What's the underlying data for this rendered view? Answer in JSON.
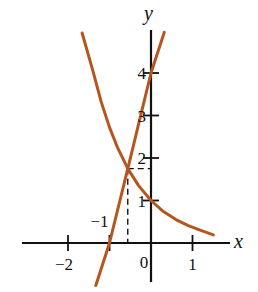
{
  "chart_data": {
    "type": "line",
    "title": "",
    "xlabel": "x",
    "ylabel": "y",
    "xlim": [
      -2.1,
      1.9
    ],
    "ylim": [
      -1.0,
      4.9
    ],
    "grid": false,
    "x_ticks": [
      -2,
      -1,
      1
    ],
    "x_tick_labels": [
      "−2",
      "−1",
      "1"
    ],
    "y_ticks": [
      1,
      2,
      3,
      4
    ],
    "y_tick_labels": [
      "1",
      "2",
      "3",
      "4"
    ],
    "origin_label": "0",
    "curve_color": "#b5561f",
    "series": [
      {
        "name": "decreasing-curve",
        "points": [
          [
            -1.66,
            4.94
          ],
          [
            -1.4,
            4.05
          ],
          [
            -1.2,
            3.32
          ],
          [
            -1.0,
            2.72
          ],
          [
            -0.8,
            2.23
          ],
          [
            -0.56,
            1.75
          ],
          [
            -0.3,
            1.35
          ],
          [
            0,
            1.0
          ],
          [
            0.3,
            0.74
          ],
          [
            0.6,
            0.55
          ],
          [
            0.9,
            0.41
          ],
          [
            1.2,
            0.3
          ],
          [
            1.5,
            0.19
          ]
        ]
      },
      {
        "name": "increasing-line",
        "points": [
          [
            -1.33,
            -1.0
          ],
          [
            -1.0,
            0
          ],
          [
            -0.56,
            1.75
          ],
          [
            0,
            4.0
          ],
          [
            0.32,
            4.96
          ]
        ]
      }
    ],
    "annotations": [
      {
        "type": "intersection-dashed-guides",
        "x": -0.56,
        "y": 1.75
      }
    ]
  }
}
